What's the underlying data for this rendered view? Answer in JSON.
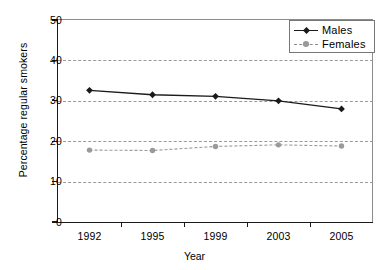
{
  "chart_data": {
    "type": "line",
    "title": "",
    "xlabel": "Year",
    "ylabel": "Percentage regular smokers",
    "categories": [
      "1992",
      "1995",
      "1999",
      "2003",
      "2005"
    ],
    "ylim": [
      0,
      50
    ],
    "yticks": [
      "0",
      "10",
      "20",
      "30",
      "40",
      "50"
    ],
    "grid": "horizontal-dashed",
    "legend_position": "top-right",
    "series": [
      {
        "name": "Males",
        "values": [
          32.6,
          31.5,
          31.1,
          30.0,
          28.0
        ],
        "color": "#1a1a1a",
        "line_style": "solid",
        "marker": "diamond"
      },
      {
        "name": "Females",
        "values": [
          17.8,
          17.7,
          18.7,
          19.1,
          18.8
        ],
        "color": "#9a9a9a",
        "line_style": "dashed",
        "marker": "circle"
      }
    ]
  },
  "axes": {
    "y_title": "Percentage regular smokers",
    "x_title": "Year"
  },
  "legend": {
    "entries": [
      {
        "label": "Males"
      },
      {
        "label": "Females"
      }
    ]
  }
}
